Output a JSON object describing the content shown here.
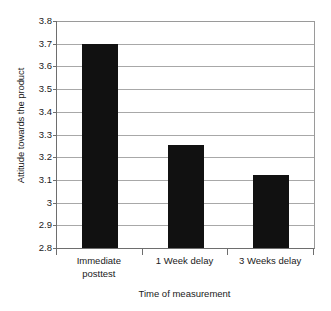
{
  "chart_data": {
    "type": "bar",
    "title": "",
    "categories": [
      "Immediate posttest",
      "1 Week delay",
      "3 Weeks delay"
    ],
    "category_lines": [
      [
        "Immediate",
        "posttest"
      ],
      [
        "1 Week delay"
      ],
      [
        "3 Weeks delay"
      ]
    ],
    "values": [
      3.7,
      3.255,
      3.12
    ],
    "xlabel": "Time of measurement",
    "ylabel": "Attitude towards the product",
    "ylim": [
      2.8,
      3.8
    ],
    "ytick_values": [
      2.8,
      2.9,
      3.0,
      3.1,
      3.2,
      3.3,
      3.4,
      3.5,
      3.6,
      3.7,
      3.8
    ],
    "ytick_labels": [
      "2.8",
      "2.9",
      "3",
      "3.1",
      "3.2",
      "3.3",
      "3.4",
      "3.5",
      "3.6",
      "3.7",
      "3.8"
    ],
    "grid": true,
    "grid_axis": "y",
    "legend": false,
    "bar_color": "#111111",
    "grid_color": "#a8a8a8",
    "axis_color": "#6e6e6e",
    "background": "#ffffff"
  }
}
